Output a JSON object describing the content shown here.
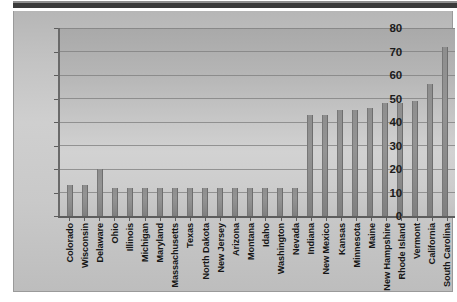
{
  "figure": {
    "frame_color": "#c3c3c3",
    "plot_bg_color": "#bdbdbd",
    "bar_color": "#8e8e8e",
    "grid_color": "#7d7d7d",
    "axis_color": "#5d5d5d"
  },
  "chart_data": {
    "type": "bar",
    "title": "",
    "subtitle": "",
    "xlabel": "",
    "ylabel": "",
    "ylim": [
      0,
      80
    ],
    "yticks": [
      0,
      10,
      20,
      30,
      40,
      50,
      60,
      70,
      80
    ],
    "ytick_labels": [
      "0",
      "10",
      "20",
      "30",
      "40",
      "50",
      "60",
      "70",
      "80"
    ],
    "grid": true,
    "legend": false,
    "legend_position": "none",
    "annotations": [],
    "categories": [
      "Colorado",
      "Wisconsin",
      "Delaware",
      "Ohio",
      "Illinois",
      "Michigan",
      "Maryland",
      "Massachusetts",
      "Texas",
      "North Dakota",
      "New Jersey",
      "Arizona",
      "Montana",
      "Idaho",
      "Washington",
      "Nevada",
      "Indiana",
      "New Mexico",
      "Kansas",
      "Minnesota",
      "Maine",
      "New Hampshire",
      "Rhode Island",
      "Vermont",
      "California",
      "South Carolina"
    ],
    "values": [
      13,
      13,
      20,
      12,
      12,
      12,
      12,
      12,
      12,
      12,
      12,
      12,
      12,
      12,
      12,
      12,
      43,
      43,
      45,
      45,
      46,
      48,
      48,
      49,
      56,
      72
    ]
  }
}
